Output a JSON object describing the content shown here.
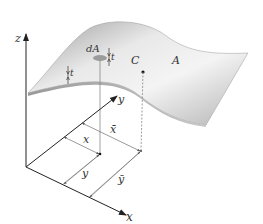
{
  "diagram": {
    "labels": {
      "z_axis": "z",
      "y_axis": "y",
      "x_axis": "x",
      "element_area": "dA",
      "thickness_left": "t",
      "thickness_element": "t",
      "centroid": "C",
      "area": "A",
      "x_dim": "x",
      "x_bar_dim": "x̄",
      "y_dim": "y",
      "y_bar_dim": "ȳ"
    },
    "colors": {
      "surface_light": "#f2f2f2",
      "surface_dark": "#a8a8a8",
      "axis": "#333333",
      "dim_line": "#777777"
    }
  }
}
